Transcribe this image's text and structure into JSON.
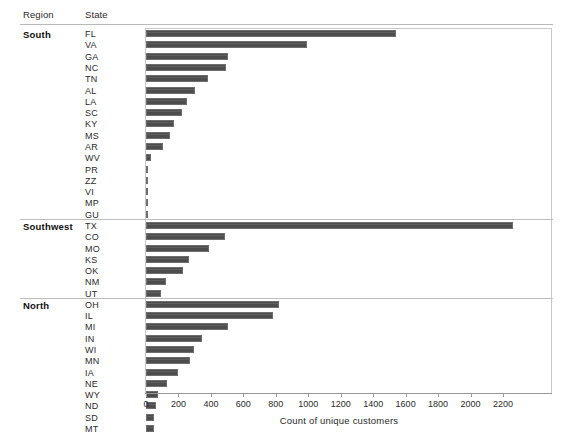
{
  "header": {
    "region_label": "Region",
    "state_label": "State"
  },
  "axis": {
    "title": "Count of unique customers",
    "ticks": [
      0,
      200,
      400,
      600,
      800,
      1000,
      1200,
      1400,
      1600,
      1800,
      2000,
      2200
    ],
    "xmin": 0,
    "xmax": 2340
  },
  "colors": {
    "bar_fill": "#4d4d4d",
    "bar_border": "#6e6e6e",
    "rule": "#bdbdbd",
    "frame": "#c9c9c9",
    "text": "#2b2b2b"
  },
  "chart_data": {
    "type": "bar",
    "orientation": "horizontal",
    "title": "",
    "xlabel": "Count of unique customers",
    "ylabel": "",
    "xlim": [
      0,
      2340
    ],
    "grid": false,
    "legend": "none",
    "group_field": "Region",
    "category_field": "State",
    "groups": [
      {
        "name": "South",
        "categories": [
          "FL",
          "VA",
          "GA",
          "NC",
          "TN",
          "AL",
          "LA",
          "SC",
          "KY",
          "MS",
          "AR",
          "WV",
          "PR",
          "ZZ",
          "VI",
          "MP",
          "GU"
        ],
        "values": [
          1540,
          990,
          505,
          495,
          385,
          300,
          255,
          220,
          175,
          145,
          105,
          30,
          5,
          2,
          1,
          1,
          1
        ]
      },
      {
        "name": "Southwest",
        "categories": [
          "TX",
          "CO",
          "MO",
          "KS",
          "OK",
          "NM",
          "UT"
        ],
        "values": [
          2260,
          485,
          390,
          265,
          230,
          125,
          95
        ]
      },
      {
        "name": "North",
        "categories": [
          "OH",
          "IL",
          "MI",
          "IN",
          "WI",
          "MN",
          "IA",
          "NE",
          "WY",
          "ND",
          "SD",
          "MT"
        ],
        "values": [
          820,
          785,
          505,
          345,
          295,
          270,
          200,
          130,
          75,
          60,
          50,
          50
        ]
      }
    ]
  }
}
